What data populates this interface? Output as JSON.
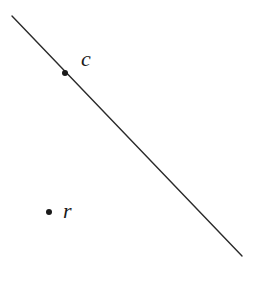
{
  "diagram": {
    "line": {
      "x1": 12,
      "y1": 16,
      "x2": 242,
      "y2": 256,
      "color": "#2a2a2a",
      "width": 1.4
    },
    "points": [
      {
        "id": "c",
        "label": "c",
        "cx": 65,
        "cy": 73,
        "r": 3,
        "label_x": 81,
        "label_y": 66
      },
      {
        "id": "r",
        "label": "r",
        "cx": 49,
        "cy": 212,
        "r": 3,
        "label_x": 63,
        "label_y": 218
      }
    ],
    "point_color": "#1a1a1a"
  }
}
